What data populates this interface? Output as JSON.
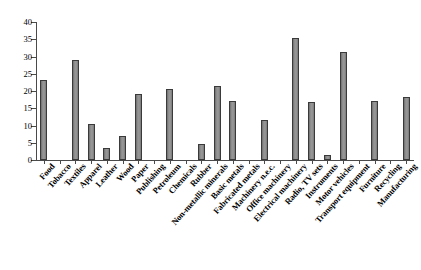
{
  "chart_data": {
    "type": "bar",
    "title": "",
    "xlabel": "",
    "ylabel": "",
    "ylim": [
      0,
      40
    ],
    "yticks": [
      0,
      5,
      10,
      15,
      20,
      25,
      30,
      35,
      40
    ],
    "grid": false,
    "legend": null,
    "bar_color": "#8d8d8d",
    "bar_edge_color": "#3a3a3a",
    "categories": [
      "Food",
      "Tobacco",
      "Textiles",
      "Apparel",
      "Leather",
      "Wood",
      "Paper",
      "Publishing",
      "Petroleum",
      "Chemicals",
      "Rubber",
      "Non-metallic minerals",
      "Basic metals",
      "Fabricated metals",
      "Machinery n.e.c.",
      "Office machinery",
      "Electrical machinery",
      "Radio, TV sets",
      "Instruments",
      "Motor vehicles",
      "Transport equipment",
      "Furniture",
      "Recycling",
      "Manufacturing"
    ],
    "values": [
      23.2,
      0,
      29.0,
      10.4,
      3.4,
      6.9,
      19.0,
      0,
      20.7,
      0,
      4.6,
      21.5,
      17.2,
      0,
      11.5,
      0,
      35.4,
      16.8,
      1.5,
      31.2,
      0,
      17.0,
      0,
      18.4
    ]
  }
}
